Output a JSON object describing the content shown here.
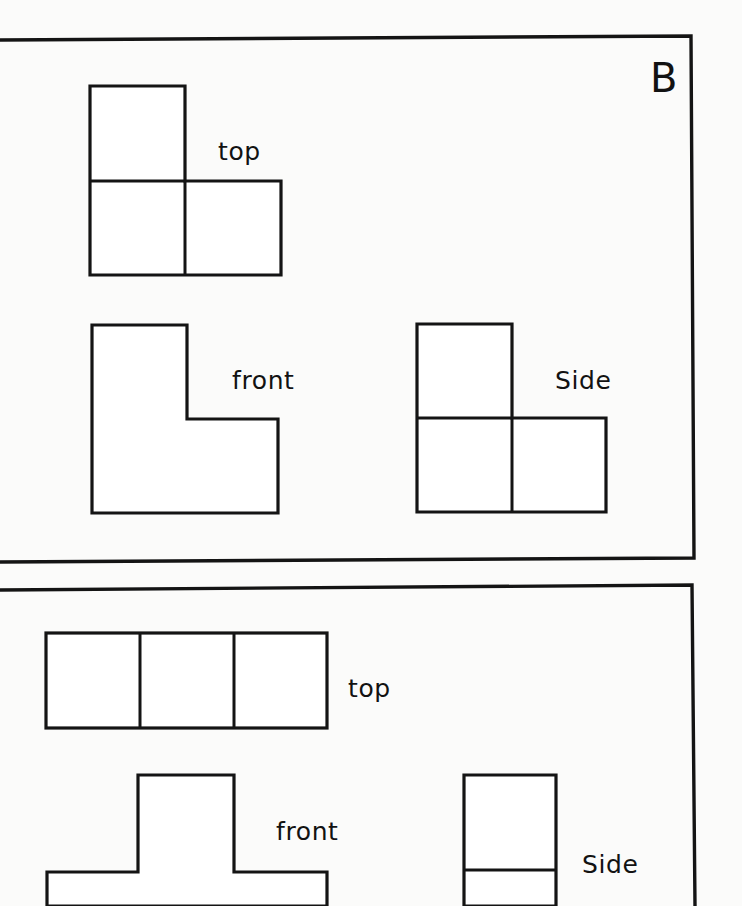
{
  "document": {
    "kind": "worksheet-scan",
    "title_letter": "B",
    "background_color": "#fdfdfc",
    "ink_color": "#141414",
    "width": 742,
    "height": 906
  },
  "panels": [
    {
      "id": "panel-b",
      "letter": "B",
      "letter_position": {
        "x": 650,
        "y": 90
      },
      "border": {
        "x": 6,
        "y": 36,
        "width": 689,
        "height": 526
      },
      "figures": [
        {
          "id": "panel-b-top",
          "label": "top",
          "label_position": {
            "x": 218,
            "y": 160
          },
          "view": "top",
          "shape": "L-tromino",
          "cells": [
            [
              0,
              0
            ],
            [
              0,
              1
            ],
            [
              1,
              1
            ]
          ],
          "cell_size": 95,
          "origin": {
            "x": 90,
            "y": 86
          },
          "has_internal_grid": true
        },
        {
          "id": "panel-b-front",
          "label": "front",
          "label_position": {
            "x": 232,
            "y": 389
          },
          "view": "front",
          "shape": "L-tromino",
          "cells": [
            [
              0,
              0
            ],
            [
              0,
              1
            ],
            [
              1,
              1
            ]
          ],
          "cell_size": 94,
          "origin": {
            "x": 92,
            "y": 325
          },
          "has_internal_grid": false
        },
        {
          "id": "panel-b-side",
          "label": "Side",
          "label_position": {
            "x": 555,
            "y": 388
          },
          "view": "side",
          "shape": "L-tromino",
          "cells": [
            [
              0,
              0
            ],
            [
              0,
              1
            ],
            [
              1,
              1
            ]
          ],
          "cell_size": 94,
          "origin": {
            "x": 417,
            "y": 324
          },
          "has_internal_grid": true
        }
      ]
    },
    {
      "id": "panel-next",
      "letter": "",
      "border": {
        "x": 6,
        "y": 586,
        "width": 689,
        "height": 320
      },
      "figures": [
        {
          "id": "panel-next-top",
          "label": "top",
          "label_position": {
            "x": 348,
            "y": 696
          },
          "view": "top",
          "shape": "I-tromino-horizontal",
          "cells": [
            [
              0,
              0
            ],
            [
              1,
              0
            ],
            [
              2,
              0
            ]
          ],
          "cell_size": 94,
          "origin": {
            "x": 46,
            "y": 633
          },
          "has_internal_grid": true
        },
        {
          "id": "panel-next-front",
          "label": "front",
          "label_position": {
            "x": 276,
            "y": 839
          },
          "view": "front",
          "shape": "T-tetromino",
          "cells": [
            [
              1,
              0
            ],
            [
              0,
              1
            ],
            [
              1,
              1
            ],
            [
              2,
              1
            ]
          ],
          "cell_size": 95,
          "origin": {
            "x": 47,
            "y": 775
          },
          "has_internal_grid": false,
          "clipped_at_bottom": true
        },
        {
          "id": "panel-next-side",
          "label": "Side",
          "label_position": {
            "x": 582,
            "y": 872
          },
          "view": "side",
          "shape": "I-domino-vertical",
          "cells": [
            [
              0,
              0
            ],
            [
              0,
              1
            ]
          ],
          "cell_size": 95,
          "origin": {
            "x": 464,
            "y": 775
          },
          "has_internal_grid": true,
          "clipped_at_bottom": true
        }
      ]
    }
  ],
  "labels": {
    "top": "top",
    "front": "front",
    "side": "Side",
    "panel_letter_b": "B"
  }
}
